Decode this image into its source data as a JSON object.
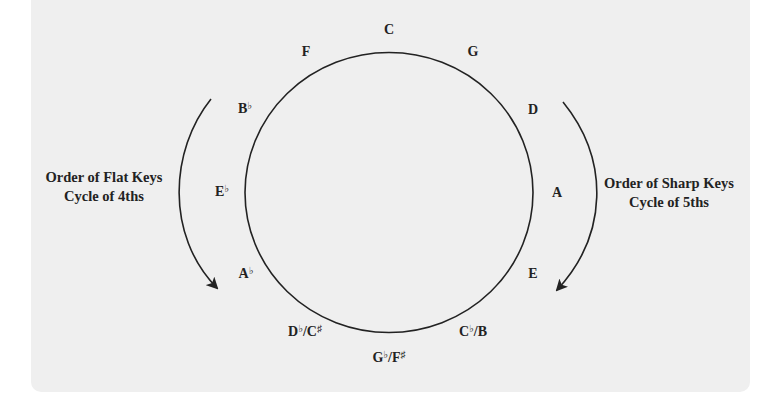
{
  "diagram": {
    "colors": {
      "panel": "#efefef",
      "stroke": "#222222",
      "text": "#222222"
    },
    "circle": {
      "cx": 389,
      "cy": 192.5,
      "rx": 144,
      "ry": 140
    },
    "keys": [
      {
        "id": "c",
        "root": "C",
        "acc": "",
        "alt": "",
        "alt_acc": "",
        "x": 389,
        "y": 30
      },
      {
        "id": "g",
        "root": "G",
        "acc": "",
        "alt": "",
        "alt_acc": "",
        "x": 473,
        "y": 52
      },
      {
        "id": "d",
        "root": "D",
        "acc": "",
        "alt": "",
        "alt_acc": "",
        "x": 533,
        "y": 110
      },
      {
        "id": "a",
        "root": "A",
        "acc": "",
        "alt": "",
        "alt_acc": "",
        "x": 557,
        "y": 193
      },
      {
        "id": "e",
        "root": "E",
        "acc": "",
        "alt": "",
        "alt_acc": "",
        "x": 533,
        "y": 274
      },
      {
        "id": "cb-b",
        "root": "C",
        "acc": "♭",
        "alt": "/B",
        "alt_acc": "",
        "x": 473,
        "y": 331
      },
      {
        "id": "gb-fs",
        "root": "G",
        "acc": "♭",
        "alt": "/F",
        "alt_acc": "♯",
        "x": 389,
        "y": 357
      },
      {
        "id": "db-cs",
        "root": "D",
        "acc": "♭",
        "alt": "/C",
        "alt_acc": "♯",
        "x": 305,
        "y": 331
      },
      {
        "id": "ab",
        "root": "A",
        "acc": "♭",
        "alt": "",
        "alt_acc": "",
        "x": 246,
        "y": 273
      },
      {
        "id": "eb",
        "root": "E",
        "acc": "♭",
        "alt": "",
        "alt_acc": "",
        "x": 222,
        "y": 191
      },
      {
        "id": "bb",
        "root": "B",
        "acc": "♭",
        "alt": "",
        "alt_acc": "",
        "x": 245,
        "y": 108
      },
      {
        "id": "f",
        "root": "F",
        "acc": "",
        "alt": "",
        "alt_acc": "",
        "x": 306,
        "y": 52
      }
    ],
    "left_caption": {
      "line1": "Order of Flat Keys",
      "line2": "Cycle of 4ths",
      "x": 104,
      "y": 187
    },
    "right_caption": {
      "line1": "Order of Sharp Keys",
      "line2": "Cycle of 5ths",
      "x": 669,
      "y": 193
    },
    "arrows": {
      "left": {
        "direction": "down",
        "path": "M211,99 C170,150 165,235 217,288"
      },
      "right": {
        "direction": "down",
        "path": "M563,102 C610,160 608,235 557,290"
      }
    }
  }
}
